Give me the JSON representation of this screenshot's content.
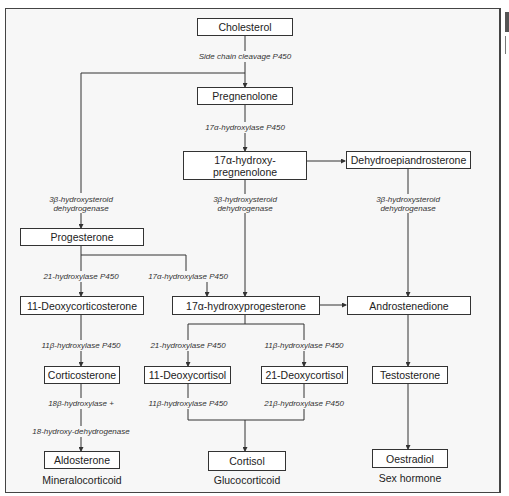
{
  "diagram": {
    "nodes": {
      "cholesterol": "Cholesterol",
      "pregnenolone": "Pregnenolone",
      "hydroxypregnenolone": "17α-hydroxy-\npregnenolone",
      "dhea": "Dehydroepiandrosterone",
      "progesterone": "Progesterone",
      "deoxycorticosterone": "11-Deoxycorticosterone",
      "hydroxyprogesterone": "17α-hydroxyprogesterone",
      "androstenedione": "Androstenedione",
      "corticosterone": "Corticosterone",
      "deoxycortisol11": "11-Deoxycortisol",
      "deoxycortisol21": "21-Deoxycortisol",
      "testosterone": "Testosterone",
      "aldosterone": "Aldosterone",
      "cortisol": "Cortisol",
      "oestradiol": "Oestradiol"
    },
    "enzymes": {
      "scc": "Side chain cleavage P450",
      "hydroxylase17a_top": "17α-hydroxylase P450",
      "hsd3b_left": "3β-hydroxysteroid\ndehydrogenase",
      "hsd3b_mid": "3β-hydroxysteroid\ndehydrogenase",
      "hsd3b_right": "3β-hydroxysteroid\ndehydrogenase",
      "hydroxylase21_left": "21-hydroxylase P450",
      "hydroxylase17a_mid": "17α-hydroxylase P450",
      "hydroxylase11b_left": "11β-hydroxylase P450",
      "hydroxylase21_mid": "21-hydroxylase P450",
      "hydroxylase11b_right": "11β-hydroxylase P450",
      "hydroxylase18b": "18β-hydroxylase +",
      "hydroxydehydrogenase18": "18-hydroxy-dehydrogenase",
      "hydroxylase11b_bottom": "11β-hydroxylase P450",
      "hydroxylase21b_bottom": "21β-hydroxylase P450"
    },
    "categories": {
      "mineralocorticoid": "Mineralocorticoid",
      "glucocorticoid": "Glucocorticoid",
      "sex_hormone": "Sex hormone"
    },
    "colors": {
      "line": "#333333",
      "box_fill": "#ffffff",
      "background": "#f7f7f7"
    }
  }
}
